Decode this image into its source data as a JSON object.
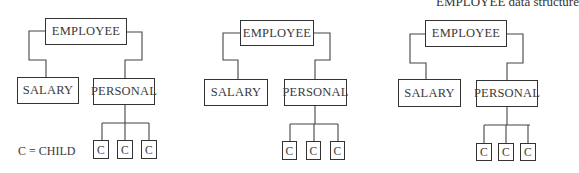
{
  "title": "EMPLOYEE data structure",
  "legend": "C = CHILD",
  "diagrams": [
    {
      "root": "EMPLOYEE",
      "children": [
        "SALARY",
        "PERSONAL"
      ],
      "grandchildren": [
        "C",
        "C",
        "C"
      ]
    },
    {
      "root": "EMPLOYEE",
      "children": [
        "SALARY",
        "PERSONAL"
      ],
      "grandchildren": [
        "C",
        "C",
        "C"
      ]
    },
    {
      "root": "EMPLOYEE",
      "children": [
        "SALARY",
        "PERSONAL"
      ],
      "grandchildren": [
        "C",
        "C",
        "C"
      ]
    }
  ]
}
